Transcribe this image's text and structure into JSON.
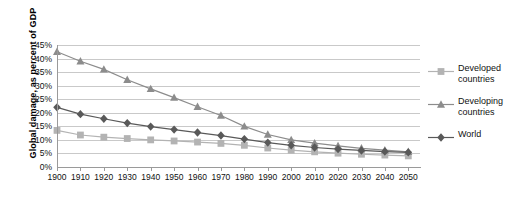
{
  "chart_data": {
    "type": "line",
    "title": "",
    "xlabel": "",
    "ylabel": "Global damage, as percent of GDP",
    "xlim": [
      1900,
      2055
    ],
    "ylim": [
      0,
      45
    ],
    "grid": true,
    "legend_position": "right",
    "x": [
      1900,
      1910,
      1920,
      1930,
      1940,
      1950,
      1960,
      1970,
      1980,
      1990,
      2000,
      2010,
      2020,
      2030,
      2040,
      2050
    ],
    "xticklabels": [
      "1900",
      "1910",
      "1920",
      "1930",
      "1940",
      "1950",
      "1960",
      "1970",
      "1980",
      "1990",
      "2000",
      "2010",
      "2020",
      "2030",
      "2040",
      "2050"
    ],
    "yticklabels": [
      "0%",
      "5%",
      "10%",
      "15%",
      "20%",
      "25%",
      "30%",
      "35%",
      "40%",
      "45%"
    ],
    "yticks": [
      0,
      5,
      10,
      15,
      20,
      25,
      30,
      35,
      40,
      45
    ],
    "series": [
      {
        "name": "Developed countries",
        "marker": "square",
        "color": "#b3b3b3",
        "values": [
          13.5,
          11.8,
          11.0,
          10.5,
          10.0,
          9.6,
          9.2,
          8.7,
          8.0,
          7.0,
          6.2,
          5.6,
          5.1,
          4.7,
          4.4,
          4.1
        ]
      },
      {
        "name": "Developing countries",
        "marker": "triangle",
        "color": "#8c8c8c",
        "values": [
          42.5,
          39.0,
          36.0,
          32.2,
          28.8,
          25.6,
          22.2,
          19.0,
          15.0,
          12.0,
          10.0,
          8.8,
          7.8,
          6.9,
          6.2,
          5.6
        ]
      },
      {
        "name": "World",
        "marker": "diamond",
        "color": "#595959",
        "values": [
          22.0,
          19.5,
          17.8,
          16.2,
          14.9,
          13.8,
          12.7,
          11.6,
          10.3,
          9.0,
          8.0,
          7.2,
          6.6,
          6.1,
          5.7,
          5.4
        ]
      }
    ]
  },
  "legend": {
    "entries": [
      {
        "label_line1": "Developed",
        "label_line2": "countries"
      },
      {
        "label_line1": "Developing",
        "label_line2": "countries"
      },
      {
        "label_line1": "World",
        "label_line2": ""
      }
    ]
  }
}
